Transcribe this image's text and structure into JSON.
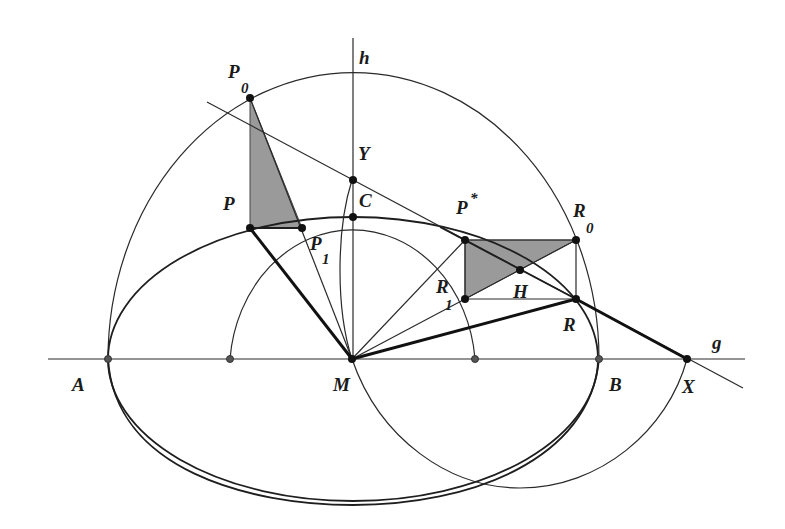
{
  "diagram": {
    "type": "geometric construction (ellipse, tangent, auxiliary circles)",
    "colors": {
      "line": "#1e1e1e",
      "shade": "#9a9a9a",
      "background": "#ffffff"
    },
    "labels": {
      "h": "h",
      "g": "g",
      "P0": {
        "base": "P",
        "sub": "0"
      },
      "P": "P",
      "P1": {
        "base": "P",
        "sub": "1"
      },
      "Y": "Y",
      "C": "C",
      "Pstar": {
        "base": "P",
        "sup": "*"
      },
      "R0": {
        "base": "R",
        "sub": "0"
      },
      "R1": {
        "base": "R",
        "sub": "1"
      },
      "H": "H",
      "R": "R",
      "A": "A",
      "M": "M",
      "B": "B",
      "X": "X"
    },
    "points": {
      "M": [
        352,
        359
      ],
      "A": [
        108,
        359
      ],
      "B": [
        599,
        359
      ],
      "X": [
        687,
        359
      ],
      "inner_left": [
        230,
        359
      ],
      "inner_right": [
        475,
        359
      ],
      "C": [
        352,
        217
      ],
      "Y": [
        352,
        180
      ],
      "P0": [
        250,
        98
      ],
      "P": [
        250,
        228
      ],
      "P1": [
        302,
        228
      ],
      "Pstar": [
        465,
        240
      ],
      "R0": [
        576,
        240
      ],
      "R1": [
        465,
        299
      ],
      "R": [
        576,
        299
      ],
      "H": [
        520,
        270
      ]
    }
  }
}
